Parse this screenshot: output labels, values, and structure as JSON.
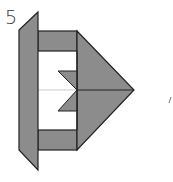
{
  "diagram": {
    "step_number": "5",
    "type": "origami-fold-step",
    "colors": {
      "paper_colored": "#8c8c8c",
      "paper_white": "#ffffff",
      "outline": "#222222",
      "crease": "#bdbdbd"
    },
    "shapes": [
      {
        "name": "left-flap",
        "description": "vertical parallelogram flap on the left side"
      },
      {
        "name": "top-band",
        "description": "horizontal colored strip at top"
      },
      {
        "name": "bottom-band",
        "description": "horizontal colored strip at bottom"
      },
      {
        "name": "right-triangle",
        "description": "arrow-shaped triangular point to the right"
      },
      {
        "name": "inner-notch",
        "description": "small zigzag colored notch in the white center area"
      },
      {
        "name": "center-crease",
        "description": "horizontal center line"
      }
    ],
    "side_mark": "/"
  }
}
